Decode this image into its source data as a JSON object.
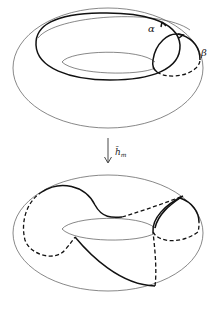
{
  "figure": {
    "top": {
      "label_alpha": "α",
      "label_beta": "β"
    },
    "map": {
      "label": "h̄",
      "subscript": "m",
      "direction": "down-arrow"
    },
    "bottom": {}
  }
}
